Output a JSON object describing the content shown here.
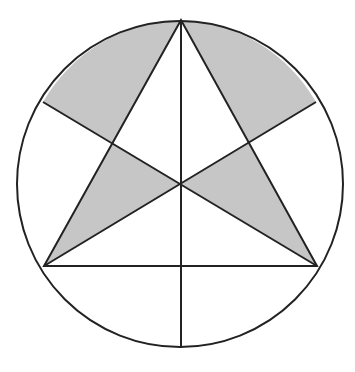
{
  "figure": {
    "colors": {
      "background": "#ffffff",
      "stroke": "#222222",
      "shade": "#c6c6c6"
    },
    "circle": {
      "cx": 180,
      "cy": 184,
      "r": 163
    },
    "triangle_vertices": {
      "top": [
        181,
        20
      ],
      "bottom_left": [
        44,
        266
      ],
      "bottom_right": [
        317,
        266
      ]
    },
    "centroid": [
      181,
      184
    ],
    "median_endpoints": {
      "vertical": [
        [
          181,
          20
        ],
        [
          181,
          348
        ]
      ],
      "from_bottom_left": [
        [
          44,
          266
        ],
        [
          316,
          102
        ]
      ],
      "from_bottom_right": [
        [
          317,
          266
        ],
        [
          43,
          102
        ]
      ]
    },
    "shaded_regions": [
      "upper-left circular segment region",
      "upper-right circular segment region",
      "lower-left inner triangle",
      "lower-right inner triangle"
    ]
  }
}
